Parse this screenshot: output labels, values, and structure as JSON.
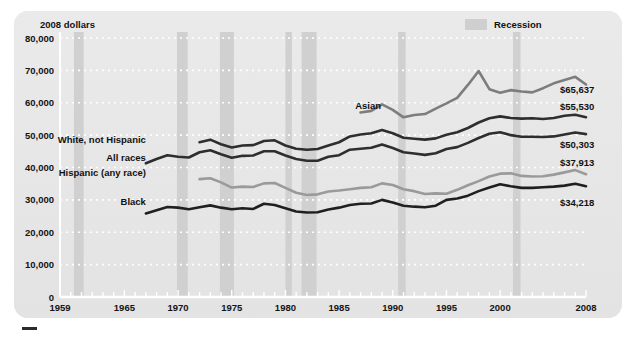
{
  "chart_data": {
    "type": "line",
    "title": "",
    "xlabel": "",
    "ylabel": "2008 dollars",
    "ylim": [
      0,
      80000
    ],
    "xlim": [
      1959,
      2008
    ],
    "grid": "dotted-horizontal",
    "ytick_labels": [
      "0",
      "10,000",
      "20,000",
      "30,000",
      "40,000",
      "50,000",
      "60,000",
      "70,000",
      "80,000"
    ],
    "ytick_values": [
      0,
      10000,
      20000,
      30000,
      40000,
      50000,
      60000,
      70000,
      80000
    ],
    "xtick_labels": [
      "1959",
      "1965",
      "1970",
      "1975",
      "1980",
      "1985",
      "1990",
      "1995",
      "2000",
      "2008"
    ],
    "xtick_values": [
      1959,
      1965,
      1970,
      1975,
      1980,
      1985,
      1990,
      1995,
      2000,
      2008
    ],
    "legend": [
      {
        "label": "Recession",
        "color": "#cfcfcf",
        "type": "band"
      }
    ],
    "legend_position": "top-right",
    "annotations": [
      {
        "text": "2008 dollars",
        "x": 1960,
        "y": 83000
      },
      {
        "text": "Recession",
        "x": 1999,
        "y": 83000
      }
    ],
    "recessions": [
      {
        "start": 1960.3,
        "end": 1961.2
      },
      {
        "start": 1969.9,
        "end": 1970.9
      },
      {
        "start": 1973.9,
        "end": 1975.2
      },
      {
        "start": 1980.0,
        "end": 1980.6
      },
      {
        "start": 1981.5,
        "end": 1982.9
      },
      {
        "start": 1990.5,
        "end": 1991.2
      },
      {
        "start": 2001.2,
        "end": 2001.9
      }
    ],
    "series": [
      {
        "name": "Asian",
        "color": "#7d7d7d",
        "end_label": "$65,637",
        "label_x": 1986.5,
        "label_y": 59000,
        "x": [
          1987,
          1988,
          1989,
          1990,
          1991,
          1992,
          1993,
          1994,
          1995,
          1996,
          1997,
          1998,
          1999,
          2000,
          2001,
          2002,
          2003,
          2004,
          2005,
          2006,
          2007,
          2008
        ],
        "values": [
          57000,
          57500,
          59500,
          57800,
          55500,
          56200,
          56500,
          58200,
          59800,
          61500,
          65500,
          69800,
          64200,
          63100,
          63900,
          63500,
          63200,
          64500,
          66000,
          67000,
          68000,
          65637
        ]
      },
      {
        "name": "White, not Hispanic",
        "color": "#2e2e2e",
        "end_label": "$55,530",
        "label_x": 1967,
        "label_y": 48500,
        "x": [
          1972,
          1973,
          1974,
          1975,
          1976,
          1977,
          1978,
          1979,
          1980,
          1981,
          1982,
          1983,
          1984,
          1985,
          1986,
          1987,
          1988,
          1989,
          1990,
          1991,
          1992,
          1993,
          1994,
          1995,
          1996,
          1997,
          1998,
          1999,
          2000,
          2001,
          2002,
          2003,
          2004,
          2005,
          2006,
          2007,
          2008
        ],
        "values": [
          47800,
          48600,
          47200,
          46200,
          46800,
          46900,
          48200,
          48400,
          46800,
          45800,
          45500,
          45700,
          46800,
          47800,
          49600,
          50200,
          50600,
          51600,
          50600,
          49200,
          48900,
          48600,
          49000,
          50100,
          50900,
          52200,
          53900,
          55200,
          55800,
          55300,
          55100,
          55200,
          55000,
          55300,
          56000,
          56300,
          55530
        ]
      },
      {
        "name": "All races",
        "color": "#2e2e2e",
        "end_label": "$50,303",
        "label_x": 1967,
        "label_y": 43000,
        "x": [
          1967,
          1968,
          1969,
          1970,
          1971,
          1972,
          1973,
          1974,
          1975,
          1976,
          1977,
          1978,
          1979,
          1980,
          1981,
          1982,
          1983,
          1984,
          1985,
          1986,
          1987,
          1988,
          1989,
          1990,
          1991,
          1992,
          1993,
          1994,
          1995,
          1996,
          1997,
          1998,
          1999,
          2000,
          2001,
          2002,
          2003,
          2004,
          2005,
          2006,
          2007,
          2008
        ],
        "values": [
          41300,
          42600,
          43800,
          43300,
          43100,
          44700,
          45300,
          44100,
          43000,
          43600,
          43700,
          45000,
          45000,
          43700,
          42600,
          42100,
          42100,
          43300,
          43800,
          45500,
          45800,
          46100,
          47100,
          46000,
          44700,
          44300,
          43900,
          44400,
          45700,
          46300,
          47600,
          49100,
          50400,
          50900,
          50000,
          49500,
          49500,
          49400,
          49600,
          50200,
          50800,
          50303
        ]
      },
      {
        "name": "Hispanic (any race)",
        "color": "#9a9a9a",
        "end_label": "$37,913",
        "label_x": 1967,
        "label_y": 38500,
        "x": [
          1972,
          1973,
          1974,
          1975,
          1976,
          1977,
          1978,
          1979,
          1980,
          1981,
          1982,
          1983,
          1984,
          1985,
          1986,
          1987,
          1988,
          1989,
          1990,
          1991,
          1992,
          1993,
          1994,
          1995,
          1996,
          1997,
          1998,
          1999,
          2000,
          2001,
          2002,
          2003,
          2004,
          2005,
          2006,
          2007,
          2008
        ],
        "values": [
          36400,
          36700,
          35400,
          33800,
          34100,
          34000,
          35100,
          35200,
          33700,
          32200,
          31500,
          31700,
          32600,
          32900,
          33300,
          33700,
          33900,
          35100,
          34600,
          33300,
          32700,
          31800,
          32000,
          31900,
          33100,
          34500,
          35800,
          37200,
          38100,
          38200,
          37400,
          37200,
          37300,
          37800,
          38500,
          39200,
          37913
        ]
      },
      {
        "name": "Black",
        "color": "#1f1f1f",
        "end_label": "$34,218",
        "label_x": 1967,
        "label_y": 29500,
        "x": [
          1967,
          1968,
          1969,
          1970,
          1971,
          1972,
          1973,
          1974,
          1975,
          1976,
          1977,
          1978,
          1979,
          1980,
          1981,
          1982,
          1983,
          1984,
          1985,
          1986,
          1987,
          1988,
          1989,
          1990,
          1991,
          1992,
          1993,
          1994,
          1995,
          1996,
          1997,
          1998,
          1999,
          2000,
          2001,
          2002,
          2003,
          2004,
          2005,
          2006,
          2007,
          2008
        ],
        "values": [
          25800,
          26800,
          27800,
          27600,
          27100,
          27700,
          28300,
          27600,
          27100,
          27400,
          27200,
          28800,
          28400,
          27400,
          26400,
          26100,
          26200,
          27000,
          27600,
          28400,
          28800,
          28900,
          30000,
          29200,
          28200,
          27900,
          27700,
          28200,
          30000,
          30400,
          31300,
          32700,
          33800,
          34800,
          34200,
          33700,
          33700,
          33900,
          34100,
          34400,
          35000,
          34218
        ]
      }
    ]
  }
}
